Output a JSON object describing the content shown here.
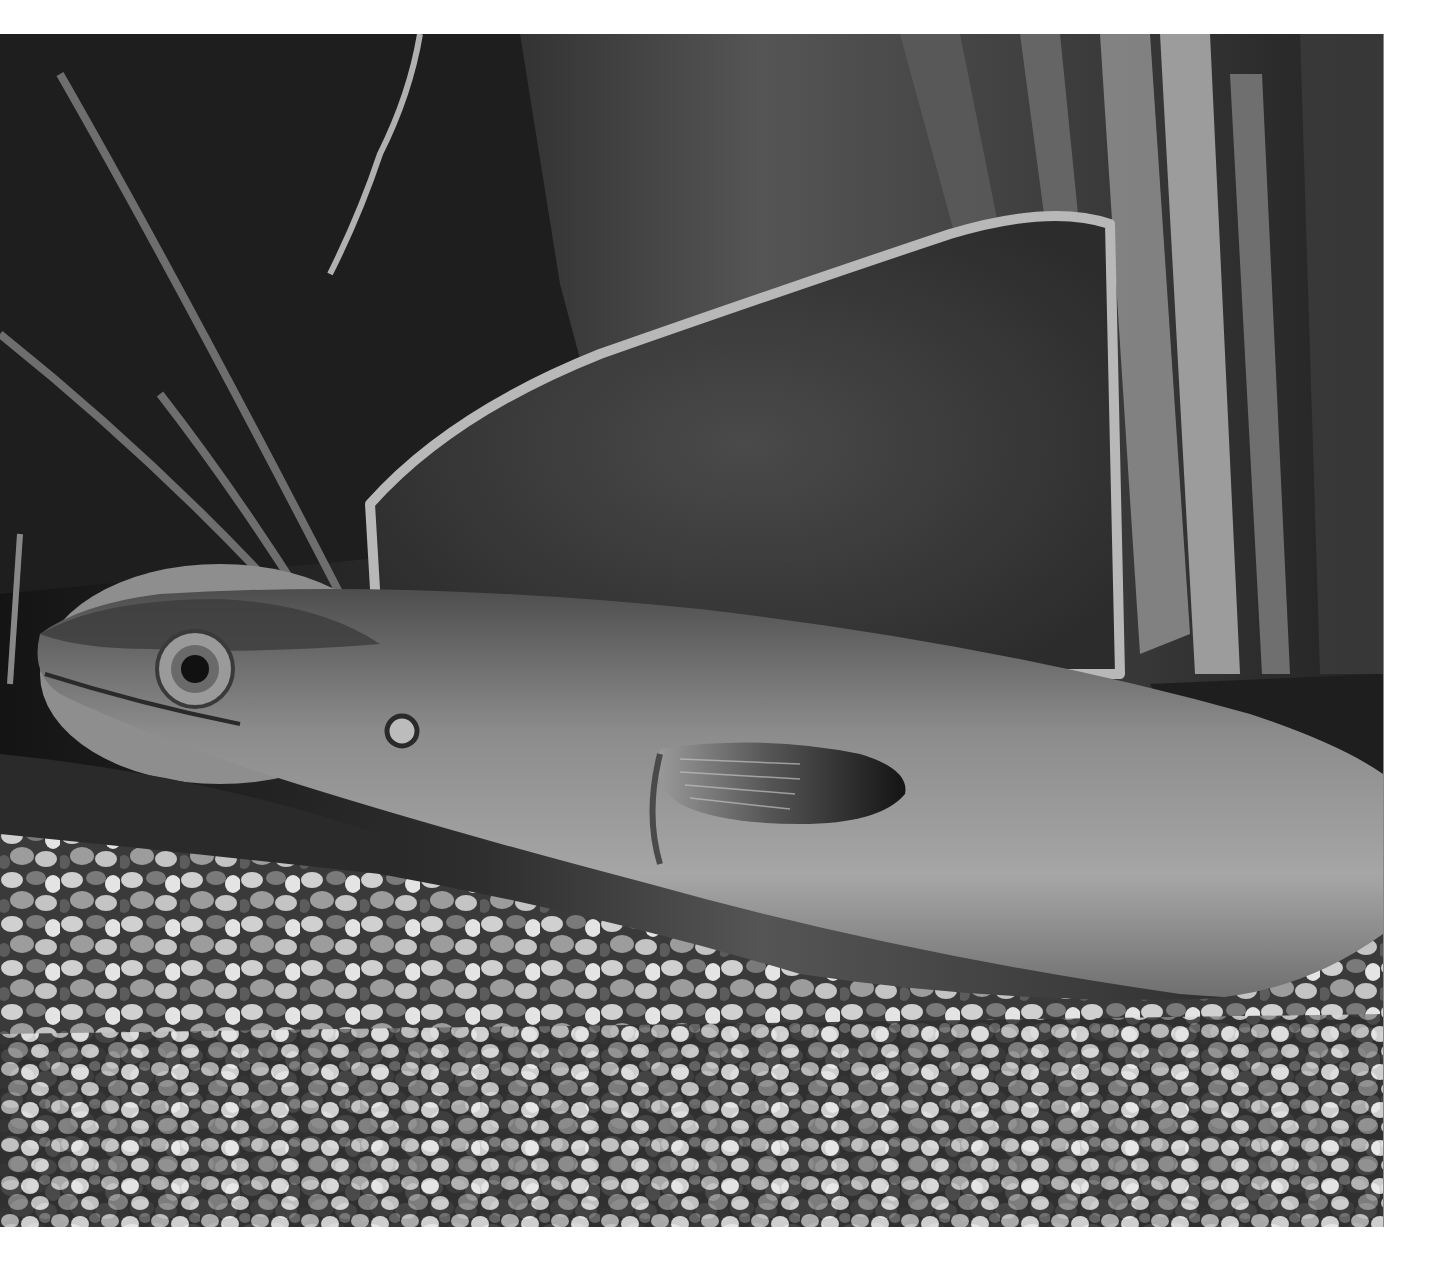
{
  "image": {
    "description": "Grayscale photograph of an eel resting on aquarium gravel in front of a large algae-covered rock and tall aquatic plant leaves",
    "palette": {
      "background_page": "#ffffff",
      "water_dark": "#1a1a1a",
      "water_mid": "#4a4a4a",
      "rock": "#5a5a5a",
      "rock_edge": "#b8b8b8",
      "eel_body": "#8a8a8a",
      "eel_highlight": "#b0b0b0",
      "fin": "#202020",
      "gravel_light": "#d8d8d8",
      "gravel_dark": "#505050"
    },
    "subjects": [
      "eel",
      "eel-eye",
      "pectoral-fin",
      "gill-pore",
      "rock",
      "plant-leaves",
      "gravel",
      "pebble-stone"
    ]
  }
}
